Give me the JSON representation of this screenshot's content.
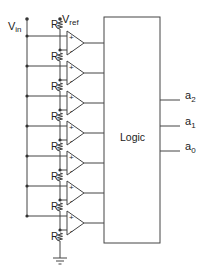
{
  "diagram": {
    "labels": {
      "vin": "V",
      "vin_sub": "in",
      "vref": "V",
      "vref_sub": "ref",
      "resistor": "R",
      "logic": "Logic"
    },
    "comparator_count": 7,
    "resistor_count": 8,
    "comparator_plus": "+",
    "comparator_minus": "-",
    "outputs": [
      {
        "name": "a",
        "sub": "2"
      },
      {
        "name": "a",
        "sub": "1"
      },
      {
        "name": "a",
        "sub": "0"
      }
    ],
    "colors": {
      "line": "#444444",
      "text": "#222222",
      "background": "#ffffff"
    }
  }
}
